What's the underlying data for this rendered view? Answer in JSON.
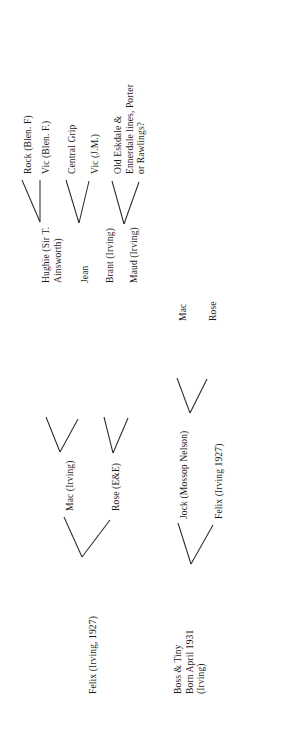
{
  "document": {
    "title": "Irving family pedigree chart",
    "orientation": "rotated-90",
    "background_color": "#ffffff",
    "ink_color": "#1c1c1c"
  },
  "nodes": {
    "felix_root": {
      "label": "Felix (Irving, 1927)"
    },
    "boss_tiny_root": {
      "line1": "Boss & Tiny",
      "line2": "Born April 1931",
      "line3": "(Irving)"
    },
    "mac_irving": {
      "label": "Mac (Irving)"
    },
    "rose_ee": {
      "label": "Rose (E&E)"
    },
    "jock_mossop": {
      "label": "Jock (Mossop Nelson)"
    },
    "felix_irving_1927": {
      "label": "Felix (Irving 1927)"
    },
    "hughie": {
      "line1": "Hughie (Sir T.",
      "line2": "Ainsworth)"
    },
    "jean": {
      "label": "Jean"
    },
    "brant_irving": {
      "label": "Brant (Irving)"
    },
    "maud_irving": {
      "label": "Maud (Irving)"
    },
    "mac": {
      "label": "Mac"
    },
    "rose": {
      "label": "Rose"
    },
    "rock_blen_f": {
      "label": "Rock (Blen. F)"
    },
    "vic_blen_f": {
      "label": "Vic (Blen. F.)"
    },
    "central_grip": {
      "label": "Central Grip"
    },
    "vic_jm": {
      "label": "Vic (J.M.)"
    },
    "old_eskdale": {
      "line1": "Old Eskdale &",
      "line2": "Ennerdale lines, Porter",
      "line3": "or Rawlings?"
    }
  }
}
